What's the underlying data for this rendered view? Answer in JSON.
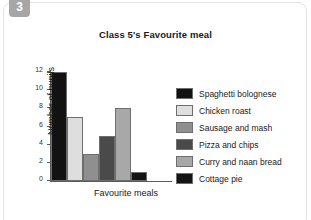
{
  "badge": {
    "number": "3"
  },
  "chart_data": {
    "type": "bar",
    "title": "Class 5's Favourite meal",
    "xlabel": "Favourite meals",
    "ylabel": "Number of pupils",
    "categories": [
      "Spaghetti bolognese",
      "Chicken roast",
      "Sausage and mash",
      "Pizza and chips",
      "Curry and naan bread",
      "Cottage pie"
    ],
    "values": [
      12,
      7,
      3,
      5,
      8,
      1
    ],
    "colors": [
      "#121212",
      "#dedede",
      "#8f8f8f",
      "#4a4a4a",
      "#a8a8a8",
      "#141414"
    ],
    "ylim": [
      0,
      12
    ],
    "yticks": [
      "0",
      "2",
      "4",
      "6",
      "8",
      "10",
      "12"
    ],
    "grid": false,
    "legend_position": "right"
  },
  "legend": {
    "items": [
      {
        "label": "Spaghetti bolognese",
        "color": "#121212"
      },
      {
        "label": "Chicken roast",
        "color": "#dedede"
      },
      {
        "label": "Sausage and mash",
        "color": "#8f8f8f"
      },
      {
        "label": "Pizza and chips",
        "color": "#4a4a4a"
      },
      {
        "label": "Curry and naan bread",
        "color": "#a8a8a8"
      },
      {
        "label": "Cottage pie",
        "color": "#141414"
      }
    ]
  }
}
